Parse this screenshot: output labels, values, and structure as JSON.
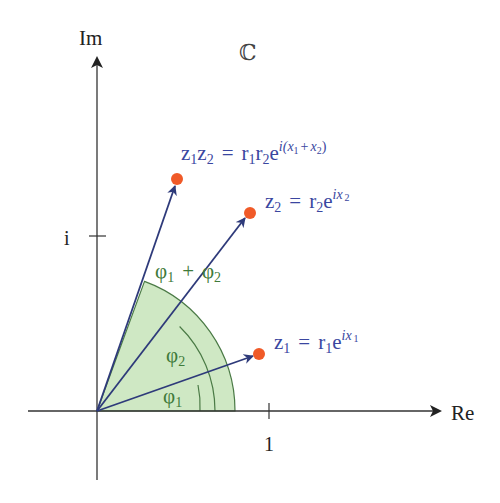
{
  "colors": {
    "axis": "#333333",
    "vector": "#2e3a7a",
    "point": "#f05a28",
    "wedge_fill": "#cfe8c4",
    "wedge_stroke": "#4a7a45",
    "label_blue": "#3a46a0",
    "label_green": "#3f7a3a"
  },
  "axes": {
    "x_label": "Re",
    "y_label": "Im",
    "x_tick_label": "1",
    "y_tick_label": "i",
    "field_symbol": "ℂ"
  },
  "points": [
    {
      "id": "z1",
      "label_base": "z",
      "label": "z₁ = r₁e^(ix₁)"
    },
    {
      "id": "z2",
      "label": "z₂ = r₂e^(ix₂)"
    },
    {
      "id": "z1z2",
      "label": "z₁z₂ = r₁r₂e^(i(x₁+x₂))"
    }
  ],
  "angles": {
    "phi1": "φ₁",
    "phi2": "φ₂",
    "sum": "φ₁ + φ₂"
  },
  "label_parts": {
    "z": "z",
    "r": "r",
    "e": "e",
    "eq": "=",
    "one": "1",
    "two": "2",
    "ix": "ix",
    "i_open": "i(",
    "x": "x",
    "plus": "+",
    "close": ")",
    "phi": "φ",
    "phi_plus": "+"
  }
}
